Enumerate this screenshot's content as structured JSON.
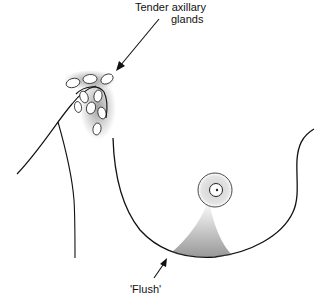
{
  "figure": {
    "labels": {
      "axillary_line1": "Tender axillary",
      "axillary_line2": "glands",
      "flush": "'Flush'"
    },
    "annotations": [
      {
        "id": "axillary-glands",
        "text": "Tender axillary glands",
        "points_to": "axillary lymph glands"
      },
      {
        "id": "flush",
        "text": "'Flush'",
        "points_to": "lower breast skin flush"
      }
    ],
    "colors": {
      "ink": "#111111",
      "stipple": "#333333",
      "background": "#ffffff"
    }
  }
}
